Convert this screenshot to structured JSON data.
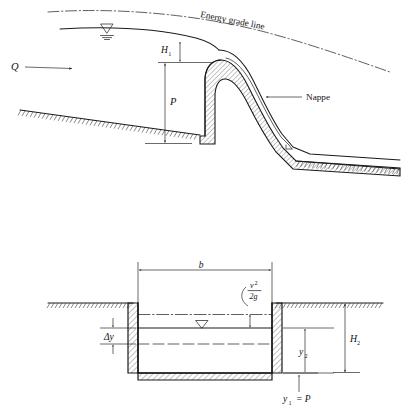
{
  "figure": {
    "panels": [
      {
        "id": "profile",
        "name": "weir-profile-view",
        "labels": {
          "discharge": "Q",
          "energy_grade_line": "Energy grade line",
          "head": "H",
          "head_sub": "1",
          "weir_height": "P",
          "nappe": "Nappe"
        },
        "symbols": {
          "water_surface": "water-surface-triangle",
          "flow_arrow": "right-arrow"
        }
      },
      {
        "id": "section",
        "name": "channel-cross-section-view",
        "labels": {
          "width": "b",
          "velocity_head_num": "v",
          "velocity_head_num_exp": "2",
          "velocity_head_den": "2g",
          "delta_y": "Δy",
          "depth_downstream": "y",
          "depth_downstream_sub": "2",
          "total_head": "H",
          "total_head_sub": "2",
          "bottom_label": "y",
          "bottom_label_sub": "1",
          "bottom_label_eq": "= P"
        },
        "symbols": {
          "water_surface": "water-surface-triangle"
        }
      }
    ],
    "colors": {
      "ink": "#1a1a1a",
      "hatch": "#2a2a2a",
      "background": "#ffffff"
    }
  }
}
